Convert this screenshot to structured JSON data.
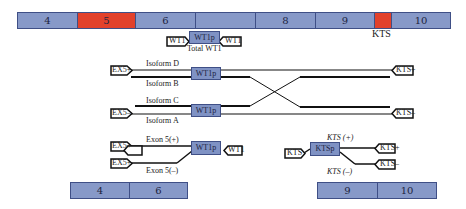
{
  "colors": {
    "exon": "#8799c8",
    "highlight": "#e2412b",
    "promoter": "#7f92c4",
    "border": "#3f4f86",
    "line": "#111111"
  },
  "gene_bar": {
    "segments": [
      {
        "label": "4",
        "highlight": false
      },
      {
        "label": "5",
        "highlight": true
      },
      {
        "label": "6",
        "highlight": false
      },
      {
        "label": "",
        "highlight": false
      },
      {
        "label": "8",
        "highlight": false
      },
      {
        "label": "9",
        "highlight": false
      },
      {
        "label": "",
        "highlight": true
      },
      {
        "label": "10",
        "highlight": false
      }
    ],
    "kts_label": "KTS"
  },
  "total": {
    "promoter": "WT1p",
    "left_tag": "WT1",
    "right_tag": "WT1",
    "caption": "Total WT1"
  },
  "isoforms": {
    "top": {
      "tag": "EX5+",
      "promoter": "WT1p",
      "label_upper": "Isoform D",
      "label_lower": "Isoform B",
      "end_tag": "KTS+"
    },
    "bottom": {
      "tag": "EX5–",
      "promoter": "WT1p",
      "label_upper": "Isoform C",
      "label_lower": "Isoform A",
      "end_tag": "KTS–"
    }
  },
  "exon5_assay": {
    "tag_plus": "EX5+",
    "tag_minus": "EX5+",
    "label_plus": "Exon 5(+)",
    "label_minus": "Exon 5(–)",
    "promoter": "WT1p",
    "end_tag": "WT1",
    "bar": [
      "4",
      "6"
    ]
  },
  "kts_assay": {
    "start_tag": "KTS",
    "promoter": "KTSp",
    "label_plus": "KTS (+)",
    "label_minus": "KTS (–)",
    "tag_plus": "KTS+",
    "tag_minus": "KTS–",
    "bar": [
      "9",
      "10"
    ]
  }
}
